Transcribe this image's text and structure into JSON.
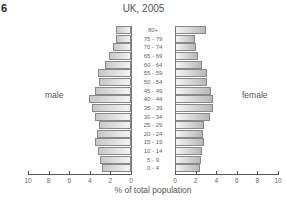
{
  "figure_number": "6",
  "chart_data": {
    "type": "bar",
    "subtype": "population-pyramid",
    "title": "UK, 2005",
    "xlabel": "% of total population",
    "ylabel": "",
    "xlim": [
      0,
      10
    ],
    "x_ticks": [
      10,
      8,
      6,
      4,
      2,
      0,
      0,
      2,
      4,
      6,
      8,
      10
    ],
    "categories": [
      "80+",
      "75 - 79",
      "70 - 74",
      "65 - 69",
      "60 - 64",
      "55 - 59",
      "50 - 54",
      "45 - 49",
      "40 - 44",
      "35 - 39",
      "30 - 34",
      "25 - 29",
      "20 - 24",
      "15 - 19",
      "10 - 14",
      "5 - 9",
      "0 - 4"
    ],
    "series": [
      {
        "name": "male",
        "values": [
          1.5,
          1.5,
          1.7,
          2.1,
          2.5,
          3.2,
          3.1,
          3.5,
          4.1,
          3.8,
          3.5,
          3.1,
          3.3,
          3.5,
          3.2,
          3.0,
          2.8
        ]
      },
      {
        "name": "female",
        "values": [
          3.0,
          1.9,
          2.0,
          2.2,
          2.6,
          3.1,
          3.1,
          3.5,
          3.7,
          3.7,
          3.4,
          2.8,
          2.7,
          2.8,
          2.6,
          2.5,
          2.4
        ]
      }
    ],
    "legend": [
      "male",
      "female"
    ],
    "grid": false
  }
}
